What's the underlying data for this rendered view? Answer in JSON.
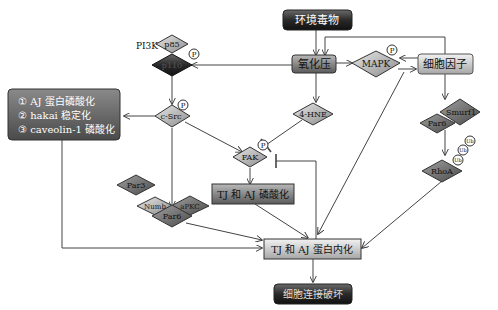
{
  "nodes": {
    "toxin": "环境毒物",
    "oxidative": "氧化压",
    "mapk": "MAPK",
    "cytokine": "细胞因子",
    "pi3k": "PI3K",
    "p85": "p85",
    "p110": "p110",
    "csrc": "c-Src",
    "hne": "4-HNE",
    "fak": "FAK",
    "smurf1": "Smurf1",
    "par6_right": "Par6",
    "rhoa": "RhoA",
    "effects_box": [
      "① AJ 蛋白磷酸化",
      "② hakai 稳定化",
      "③ caveolin-1 磷酸化"
    ],
    "par3": "Par3",
    "numb": "Numb",
    "apkc": "aPKC",
    "par6_left": "Par6",
    "tj_aj_phos": "TJ 和 AJ 磷酸化",
    "tj_aj_intern": "TJ 和 AJ 蛋白内化",
    "junction_disrupt": "细胞连接破坏"
  },
  "badges": {
    "phospho": "P",
    "ubiquitin": "Ub"
  }
}
